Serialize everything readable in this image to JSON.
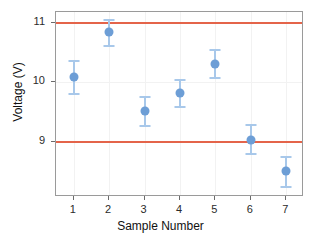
{
  "chart_data": {
    "type": "scatter",
    "title": "",
    "xlabel": "Sample Number",
    "ylabel": "Voltage (V)",
    "x": [
      1,
      2,
      3,
      4,
      5,
      6,
      7
    ],
    "values": [
      10.08,
      10.85,
      9.51,
      9.81,
      10.3,
      9.02,
      8.5
    ],
    "error_low": [
      9.78,
      10.6,
      9.25,
      9.56,
      10.05,
      8.78,
      8.22
    ],
    "error_high": [
      10.38,
      11.07,
      9.76,
      10.06,
      10.55,
      9.3,
      8.76
    ],
    "xtick_labels": [
      "1",
      "2",
      "3",
      "4",
      "5",
      "6",
      "7"
    ],
    "ytick_labels": [
      "9",
      "10",
      "11"
    ],
    "ytick_values": [
      9,
      10,
      11
    ],
    "xlim": [
      0.5,
      7.5
    ],
    "ylim": [
      8.07,
      11.18
    ],
    "grid": true,
    "legend": "none",
    "reference_lines": [
      {
        "name": "upper-spec-limit",
        "value": 11
      },
      {
        "name": "lower-spec-limit",
        "value": 9
      }
    ],
    "colors": {
      "point": "#6d9ed6",
      "error_bar": "#a8c8ea",
      "reference_line": "#e4644a",
      "grid": "#f2f2f2",
      "panel_border": "#9a9a9a",
      "background": "#ffffff",
      "text": "#111111"
    }
  }
}
